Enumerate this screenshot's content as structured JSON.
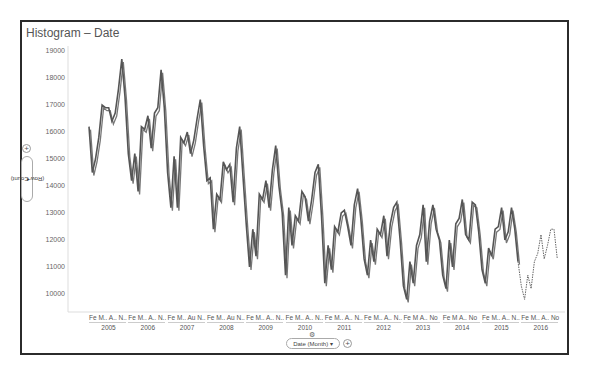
{
  "title": "Histogram – Date",
  "y_axis_control": {
    "label": "(Row Count)",
    "dropdown_icon": "chevron-down-icon",
    "add_icon": "plus-icon"
  },
  "x_axis_control": {
    "label": "Date (Month)",
    "dropdown_icon": "chevron-down-icon",
    "add_icon": "plus-icon",
    "settings_icon": "gear-icon"
  },
  "chart_data": {
    "type": "line",
    "title": "Histogram – Date",
    "xlabel": "Date (Month)",
    "ylabel": "(Row Count)",
    "ylim": [
      9500,
      19200
    ],
    "yticks": [
      10000,
      11000,
      12000,
      13000,
      14000,
      15000,
      16000,
      17000,
      18000,
      19000
    ],
    "grid": false,
    "legend": "none",
    "x_year_labels": [
      "2005",
      "2006",
      "2007",
      "2008",
      "2009",
      "2010",
      "2011",
      "2012",
      "2013",
      "2014",
      "2015",
      "2016"
    ],
    "x_month_labels": [
      "Fe M.. A.. N..",
      "Fe M.. A.. N..",
      "Fe M.. Au N..",
      "Fe M.. Au N..",
      "Fe M.. A.. N..",
      "Fe M.. A.. N..",
      "Fe M.. A.. N..",
      "Fe M.. A.. N..",
      "Fe  M  A.. No",
      "Fe  M  A.. No",
      "Fe M.. A.. N..",
      "Fe M.. A.. No"
    ],
    "series": [
      {
        "name": "Row Count",
        "style": "solid",
        "values": [
          16200,
          14500,
          15000,
          15800,
          17000,
          16900,
          16900,
          16400,
          16700,
          17600,
          18700,
          17300,
          15200,
          14200,
          15200,
          13800,
          16200,
          16100,
          16600,
          15400,
          16700,
          16900,
          18300,
          16900,
          14500,
          13200,
          15100,
          13200,
          15800,
          15600,
          16000,
          15200,
          15700,
          16500,
          17200,
          15500,
          14200,
          14300,
          12400,
          13700,
          13500,
          14900,
          14600,
          14800,
          13400,
          15400,
          16200,
          14400,
          12600,
          11000,
          12400,
          11400,
          13700,
          13500,
          14200,
          13200,
          14600,
          15500,
          14000,
          13000,
          10700,
          13200,
          11800,
          12900,
          12700,
          13800,
          13600,
          12700,
          13500,
          14500,
          14800,
          12900,
          10400,
          11800,
          10900,
          12500,
          12300,
          13000,
          13100,
          12500,
          11800,
          13300,
          13900,
          12800,
          11300,
          10700,
          12000,
          11200,
          12400,
          12200,
          12900,
          11400,
          12600,
          13200,
          13400,
          12000,
          10300,
          9800,
          11200,
          10400,
          11800,
          12200,
          13300,
          11200,
          12700,
          13300,
          12400,
          12000,
          10700,
          10200,
          12000,
          11000,
          12600,
          12800,
          13500,
          12200,
          12000,
          13400,
          13300,
          12300,
          10900,
          10400,
          11700,
          11400,
          12400,
          12500,
          13200,
          12000,
          12300,
          13200,
          12400,
          11200
        ],
        "start": "2005-01"
      },
      {
        "name": "Row Count (forecast)",
        "style": "dotted",
        "values": [
          11200,
          10300,
          9800,
          10700,
          10200,
          11200,
          11500,
          12200,
          11300,
          11800,
          12400,
          12400,
          11300
        ],
        "start": "2015-12"
      }
    ]
  }
}
